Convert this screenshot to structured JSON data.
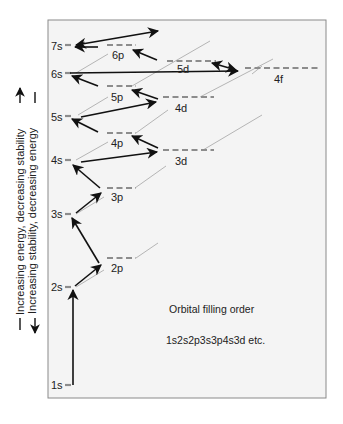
{
  "diagram": {
    "title": "Orbital filling order",
    "sequence": "1s2s2p3s3p4s3d etc.",
    "side_labels": {
      "up": "Increasing energy, decreasing stability",
      "down": "Increasing stability, decreasing energy"
    },
    "colors": {
      "panel_bg": "#f4f4f4",
      "frame": "#8a8a8a",
      "level": "#8c8c8c",
      "guide": "#b5b5b5",
      "arrow": "#111111"
    },
    "orbitals": [
      {
        "name": "1s",
        "label": "1s"
      },
      {
        "name": "2s",
        "label": "2s"
      },
      {
        "name": "2p",
        "label": "2p"
      },
      {
        "name": "3s",
        "label": "3s"
      },
      {
        "name": "3p",
        "label": "3p"
      },
      {
        "name": "4s",
        "label": "4s"
      },
      {
        "name": "3d",
        "label": "3d"
      },
      {
        "name": "4p",
        "label": "4p"
      },
      {
        "name": "5s",
        "label": "5s"
      },
      {
        "name": "4d",
        "label": "4d"
      },
      {
        "name": "5p",
        "label": "5p"
      },
      {
        "name": "6s",
        "label": "6s"
      },
      {
        "name": "4f",
        "label": "4f"
      },
      {
        "name": "5d",
        "label": "5d"
      },
      {
        "name": "6p",
        "label": "6p"
      },
      {
        "name": "7s",
        "label": "7s"
      }
    ]
  }
}
